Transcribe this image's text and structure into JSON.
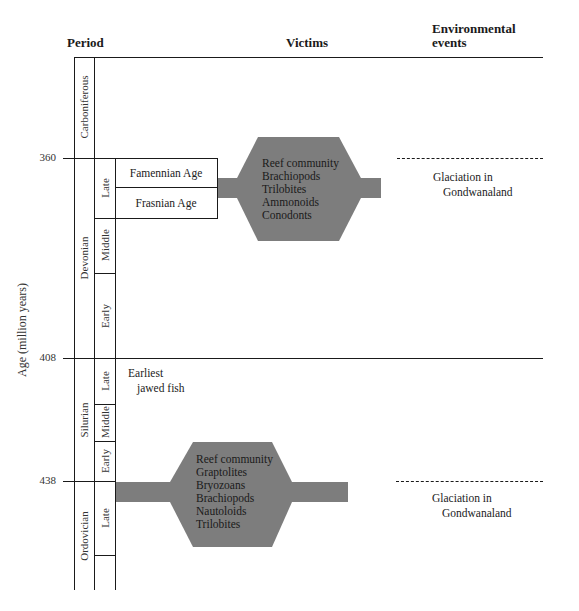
{
  "headers": {
    "period": "Period",
    "victims": "Victims",
    "environmental_line1": "Environmental",
    "environmental_line2": "events"
  },
  "y_axis": {
    "label": "Age (million years)",
    "ticks": [
      "360",
      "408",
      "438"
    ]
  },
  "periods": [
    {
      "name": "Carboniferous"
    },
    {
      "name": "Devonian",
      "epochs": [
        "Late",
        "Middle",
        "Early"
      ]
    },
    {
      "name": "Silurian",
      "epochs": [
        "Late",
        "Middle",
        "Early"
      ]
    },
    {
      "name": "Ordovician",
      "epochs": [
        "Late"
      ]
    }
  ],
  "ages": {
    "famennian": "Famennian Age",
    "frasnian": "Frasnian Age"
  },
  "notes": {
    "jawed_fish_line1": "Earliest",
    "jawed_fish_line2": "jawed fish"
  },
  "extinctions": [
    {
      "period": "Devonian",
      "victims": [
        "Reef community",
        "Brachiopods",
        "Trilobites",
        "Ammonoids",
        "Conodonts"
      ],
      "event_line1": "Glaciation in",
      "event_line2": "Gondwanaland"
    },
    {
      "period": "Ordovician",
      "victims": [
        "Reef community",
        "Graptolites",
        "Bryozoans",
        "Brachiopods",
        "Nautoloids",
        "Trilobites"
      ],
      "event_line1": "Glaciation in",
      "event_line2": "Gondwanaland"
    }
  ],
  "colors": {
    "extinction_fill": "#7d7d7d",
    "line": "#1a1a1a",
    "background": "#ffffff"
  }
}
